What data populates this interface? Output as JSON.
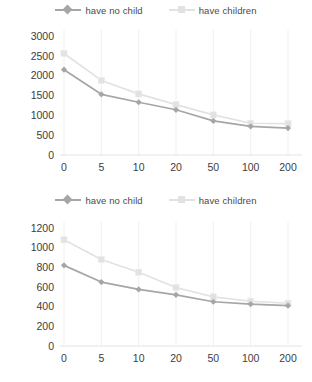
{
  "charts": [
    {
      "id": "chart-top",
      "legend": [
        {
          "label": "have no child",
          "color": "#a6a6a6",
          "marker": "diamond"
        },
        {
          "label": "have children",
          "color": "#e2e2e2",
          "marker": "square"
        }
      ],
      "chart_data": {
        "type": "line",
        "title": "",
        "xlabel": "",
        "ylabel": "",
        "categories": [
          "0",
          "5",
          "10",
          "20",
          "50",
          "100",
          "200"
        ],
        "yticks": [
          "0",
          "500",
          "1000",
          "1500",
          "2000",
          "2500",
          "3000"
        ],
        "ylim": [
          0,
          3000
        ],
        "grid": true,
        "legend_position": "top-center",
        "series": [
          {
            "name": "have no child",
            "color": "#a6a6a6",
            "marker": "diamond",
            "values": [
              2150,
              1530,
              1330,
              1140,
              860,
              720,
              680
            ]
          },
          {
            "name": "have children",
            "color": "#e2e2e2",
            "marker": "square",
            "values": [
              2560,
              1880,
              1540,
              1270,
              1010,
              800,
              790
            ]
          }
        ]
      }
    },
    {
      "id": "chart-bottom",
      "legend": [
        {
          "label": "have no child",
          "color": "#a6a6a6",
          "marker": "diamond"
        },
        {
          "label": "have children",
          "color": "#e2e2e2",
          "marker": "square"
        }
      ],
      "chart_data": {
        "type": "line",
        "title": "",
        "xlabel": "",
        "ylabel": "",
        "categories": [
          "0",
          "5",
          "10",
          "20",
          "50",
          "100",
          "200"
        ],
        "yticks": [
          "0",
          "200",
          "400",
          "600",
          "800",
          "1000",
          "1200"
        ],
        "ylim": [
          0,
          1200
        ],
        "grid": true,
        "legend_position": "top-center",
        "series": [
          {
            "name": "have no child",
            "color": "#a6a6a6",
            "marker": "diamond",
            "values": [
              820,
              650,
              575,
              520,
              450,
              425,
              410
            ]
          },
          {
            "name": "have children",
            "color": "#e2e2e2",
            "marker": "square",
            "values": [
              1080,
              880,
              750,
              595,
              500,
              455,
              435
            ]
          }
        ]
      }
    }
  ],
  "colors": {
    "series_no_child": "#a6a6a6",
    "series_children": "#e2e2e2",
    "grid": "#f0f0f0",
    "text": "#3d3d3d",
    "background": "#ffffff"
  }
}
